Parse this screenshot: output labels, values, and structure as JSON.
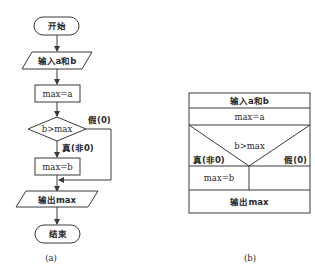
{
  "flowchart_a": {
    "start": "开始",
    "input": "输入a和b",
    "assign_a": "max=a",
    "condition": "b>max",
    "false_label": "假(0)",
    "true_label": "真(非0)",
    "assign_b": "max=b",
    "output": "输出max",
    "end": "结束",
    "caption": "(a)"
  },
  "ns_chart_b": {
    "input": "输入a和b",
    "assign_a": "max=a",
    "condition": "b>max",
    "true_label": "真(非0)",
    "false_label": "假(0)",
    "assign_b": "max=b",
    "output": "输出max",
    "caption": "(b)"
  }
}
